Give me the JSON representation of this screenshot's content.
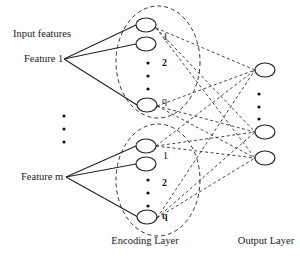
{
  "diagram": {
    "input_labels": {
      "title": "Input features",
      "feature_1": "Feature 1",
      "feature_m": "Feature m"
    },
    "encoding_group_1": {
      "node_labels": [
        "1",
        "2",
        "q"
      ]
    },
    "encoding_group_2": {
      "node_labels": [
        "1",
        "2",
        "q"
      ]
    },
    "layer_labels": {
      "encoding": "Encoding Layer",
      "output": "Output Layer"
    },
    "colors": {
      "stroke": "#222222",
      "background": "#ffffff"
    }
  }
}
